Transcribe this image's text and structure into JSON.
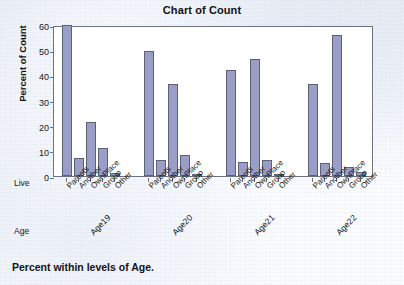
{
  "chart_data": {
    "type": "bar",
    "title": "Chart of Count",
    "xlabel": "",
    "ylabel": "Percent of Count",
    "ylim": [
      0,
      60
    ],
    "yticks": [
      0,
      10,
      20,
      30,
      40,
      50,
      60
    ],
    "grid": false,
    "legend": "none",
    "footnote": "Percent within levels of Age.",
    "row_headers": {
      "inner": "Live",
      "outer": "Age"
    },
    "categories": [
      "Parents",
      "Another",
      "OwnPlace",
      "Group",
      "Other"
    ],
    "groups": [
      "Age19",
      "Age20",
      "Age21",
      "Age22"
    ],
    "series": [
      {
        "name": "Age19",
        "values": [
          60.0,
          7.0,
          21.5,
          11.0,
          1.0
        ]
      },
      {
        "name": "Age20",
        "values": [
          49.5,
          6.4,
          36.5,
          8.2,
          0.4
        ]
      },
      {
        "name": "Age21",
        "values": [
          42.2,
          5.5,
          46.5,
          6.5,
          0.7
        ]
      },
      {
        "name": "Age22",
        "values": [
          36.6,
          5.0,
          56.0,
          3.5,
          1.4
        ]
      }
    ],
    "bar_color": "#9a9ec6",
    "bar_edge_color": "#5d6176",
    "axis_color": "#6d7280",
    "plot_background": "#ffffff"
  }
}
